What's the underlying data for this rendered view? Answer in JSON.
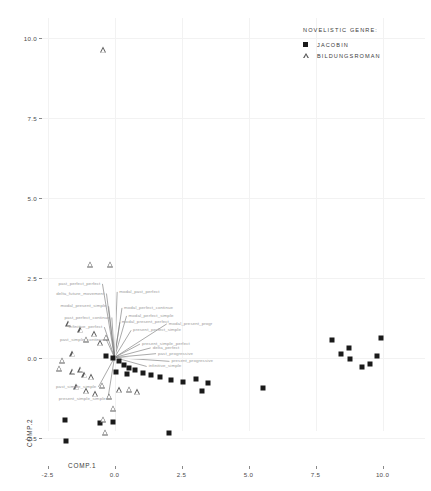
{
  "chart_data": {
    "type": "scatter",
    "title": "",
    "xlabel": "COMP.1",
    "ylabel": "COMP.2",
    "xlim": [
      -3.2,
      10.8
    ],
    "ylim": [
      -3.2,
      10.6
    ],
    "xticks": [
      -2.5,
      0.0,
      2.5,
      5.0,
      7.5,
      10.0
    ],
    "yticks": [
      -2.5,
      0.0,
      2.5,
      5.0,
      7.5,
      10.0
    ],
    "xtick_labels": [
      "-2.5",
      "0.0",
      "2.5",
      "5.0",
      "7.5",
      "10.0"
    ],
    "ytick_labels": [
      "-2.5",
      "0.0",
      "2.5",
      "5.0",
      "7.5",
      "10.0"
    ],
    "grid": true,
    "legend_position": "top-right",
    "series": [
      {
        "name": "JACOBIN",
        "marker": "filled-square",
        "color": "#1a1a1a",
        "points": [
          [
            -0.3,
            0.05
          ],
          [
            -0.05,
            0.0
          ],
          [
            0.15,
            -0.1
          ],
          [
            0.35,
            -0.22
          ],
          [
            0.55,
            -0.32
          ],
          [
            0.05,
            -0.45
          ],
          [
            0.45,
            -0.52
          ],
          [
            0.75,
            -0.4
          ],
          [
            1.05,
            -0.48
          ],
          [
            1.35,
            -0.55
          ],
          [
            1.7,
            -0.62
          ],
          [
            2.1,
            -0.7
          ],
          [
            2.55,
            -0.75
          ],
          [
            3.05,
            -0.68
          ],
          [
            3.5,
            -0.8
          ],
          [
            -1.85,
            -1.95
          ],
          [
            -0.55,
            -2.05
          ],
          [
            -0.05,
            -2.0
          ],
          [
            -1.8,
            -2.6
          ],
          [
            2.05,
            -2.35
          ],
          [
            3.25,
            -1.05
          ],
          [
            5.55,
            -0.95
          ],
          [
            8.1,
            0.55
          ],
          [
            8.45,
            0.12
          ],
          [
            8.75,
            0.3
          ],
          [
            8.8,
            -0.05
          ],
          [
            9.25,
            -0.3
          ],
          [
            9.55,
            -0.2
          ],
          [
            9.95,
            0.6
          ],
          [
            9.8,
            0.05
          ]
        ]
      },
      {
        "name": "BILDUNGSROMAN",
        "marker": "open-triangle",
        "color": "#5a5a5a",
        "points": [
          [
            -0.4,
            9.6
          ],
          [
            -0.9,
            2.9
          ],
          [
            -0.15,
            2.9
          ],
          [
            -1.7,
            1.05
          ],
          [
            -1.25,
            0.85
          ],
          [
            -1.05,
            0.55
          ],
          [
            -0.75,
            0.72
          ],
          [
            -0.52,
            0.45
          ],
          [
            -0.3,
            0.62
          ],
          [
            -1.55,
            0.1
          ],
          [
            -1.95,
            -0.1
          ],
          [
            -2.05,
            -0.35
          ],
          [
            -1.55,
            -0.45
          ],
          [
            -1.25,
            -0.38
          ],
          [
            -1.1,
            -0.55
          ],
          [
            -0.85,
            -0.62
          ],
          [
            -1.4,
            -0.92
          ],
          [
            -1.05,
            -1.05
          ],
          [
            -0.72,
            -1.15
          ],
          [
            -0.45,
            -0.88
          ],
          [
            -0.2,
            -1.22
          ],
          [
            0.2,
            -1.02
          ],
          [
            0.55,
            -1.0
          ],
          [
            0.85,
            -1.08
          ],
          [
            -0.05,
            -1.6
          ],
          [
            -0.4,
            -1.95
          ],
          [
            -0.35,
            -2.35
          ]
        ]
      }
    ],
    "vectors": {
      "origin": [
        0.0,
        0.0
      ],
      "color": "#7c7c7c",
      "items": [
        {
          "label": "past_perfect_perfect",
          "dx": -0.45,
          "dy": 2.3
        },
        {
          "label": "delta_future_movement",
          "dx": -0.3,
          "dy": 2.0
        },
        {
          "label": "modal_past_perfect",
          "dx": 0.1,
          "dy": 2.05
        },
        {
          "label": "modal_present_simple",
          "dx": -0.22,
          "dy": 1.6
        },
        {
          "label": "modal_perfect_continue",
          "dx": 0.28,
          "dy": 1.55
        },
        {
          "label": "modal_perfect_simple",
          "dx": 0.45,
          "dy": 1.3
        },
        {
          "label": "past_perfect_continue",
          "dx": -0.1,
          "dy": 1.25
        },
        {
          "label": "modal_present_perfect",
          "dx": 0.2,
          "dy": 1.1
        },
        {
          "label": "infinitive_perfect",
          "dx": -0.38,
          "dy": 0.95
        },
        {
          "label": "present_perfect_simple",
          "dx": 0.62,
          "dy": 0.85
        },
        {
          "label": "modal_present_progr",
          "dx": 1.95,
          "dy": 1.05
        },
        {
          "label": "past_simple_continue",
          "dx": -0.3,
          "dy": 0.55
        },
        {
          "label": "present_simple_perfect",
          "dx": 0.95,
          "dy": 0.42
        },
        {
          "label": "delta_perfect",
          "dx": 1.35,
          "dy": 0.3
        },
        {
          "label": "past_progressive",
          "dx": 1.55,
          "dy": 0.12
        },
        {
          "label": "present_progressive",
          "dx": 2.05,
          "dy": -0.12
        },
        {
          "label": "infinitive_simple",
          "dx": 1.2,
          "dy": -0.28
        },
        {
          "label": "past_simple_simple",
          "dx": -0.6,
          "dy": -0.92
        },
        {
          "label": "present_simple_simple",
          "dx": -0.25,
          "dy": -1.3
        }
      ]
    }
  },
  "legend": {
    "title": "NOVELISTIC GENRE:",
    "entries": [
      {
        "label": "JACOBIN"
      },
      {
        "label": "BILDUNGSROMAN"
      }
    ]
  }
}
